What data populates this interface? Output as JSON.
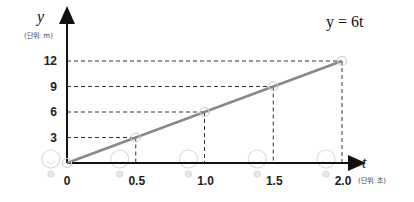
{
  "chart_data": {
    "type": "line",
    "title": "",
    "equation": "y = 6t",
    "xlabel": "t",
    "ylabel": "y",
    "x_unit": "(단위: 초)",
    "y_unit": "(단위: m)",
    "x": [
      0,
      0.5,
      1.0,
      1.5,
      2.0
    ],
    "series": [
      {
        "name": "y = 6t",
        "values": [
          0,
          3,
          6,
          9,
          12
        ],
        "color": "#888888"
      }
    ],
    "x_ticks": [
      "0",
      "0.5",
      "1.0",
      "1.5",
      "2.0"
    ],
    "y_ticks": [
      "3",
      "6",
      "9",
      "12"
    ],
    "xlim": [
      0,
      2.0
    ],
    "ylim": [
      0,
      12
    ],
    "grid": "dashed guide lines from points to axes",
    "legend": "none"
  },
  "labels": {
    "equation": "y = 6t",
    "y_var": "y",
    "y_unit": "(단위: m)",
    "t_var": "t",
    "t_unit": "(단위: 초)",
    "origin": "0"
  }
}
